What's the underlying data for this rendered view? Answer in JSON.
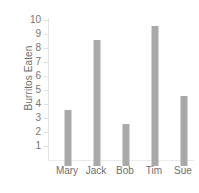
{
  "chart_data": {
    "type": "bar",
    "title": "",
    "subtitle": "",
    "xlabel": "",
    "ylabel": "Burritos Eaten",
    "categories": [
      "Mary",
      "Jack",
      "Bob",
      "Tim",
      "Sue"
    ],
    "values": [
      4,
      9,
      3,
      10,
      5
    ],
    "ylim": [
      0,
      10
    ],
    "y_ticks": [
      10,
      9,
      8,
      7,
      6,
      5,
      4,
      3,
      2,
      1
    ],
    "grid": false,
    "legend": null,
    "legend_position": "none",
    "orientation": "vertical",
    "colors": {
      "bar": "#a9a9a9",
      "axis_line": "#e3e3e3",
      "tick_text": "#767676",
      "label_text": "#6e6e6e",
      "background": "#ffffff"
    }
  }
}
